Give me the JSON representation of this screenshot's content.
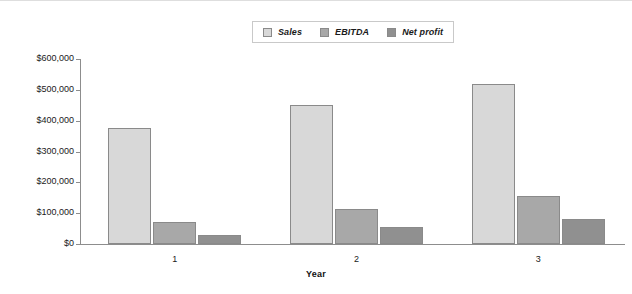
{
  "chart_data": {
    "type": "bar",
    "title": "",
    "subtitle": "",
    "xlabel": "Year",
    "ylabel": "",
    "categories": [
      "1",
      "2",
      "3"
    ],
    "series": [
      {
        "name": "Sales",
        "values": [
          375000,
          450000,
          520000
        ],
        "color": "#d8d8d8"
      },
      {
        "name": "EBITDA",
        "values": [
          73000,
          113000,
          155000
        ],
        "color": "#a8a8a8"
      },
      {
        "name": "Net profit",
        "values": [
          30000,
          55000,
          80000
        ],
        "color": "#909090"
      }
    ],
    "ylim": [
      0,
      600000
    ],
    "ytick_values": [
      0,
      100000,
      200000,
      300000,
      400000,
      500000,
      600000
    ],
    "ytick_labels": [
      "$0",
      "$100,000",
      "$200,000",
      "$300,000",
      "$400,000",
      "$500,000",
      "$600,000"
    ],
    "grid": false,
    "legend_position": "top-center",
    "bar_border_color": "#8a8a8a",
    "axis_color": "#8d8d8d"
  }
}
